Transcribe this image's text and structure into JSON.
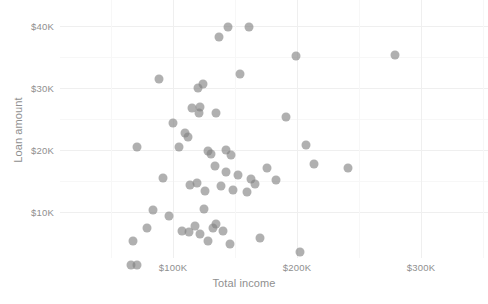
{
  "chart_data": {
    "type": "scatter",
    "title": "",
    "xlabel": "Total income",
    "ylabel": "Loan amount",
    "xlim": [
      28000,
      345000
    ],
    "ylim": [
      500,
      42500
    ],
    "grid": true,
    "legend": false,
    "marker_color": "#808080",
    "marker_opacity": 0.62,
    "gridline_color": "#efefef",
    "axis_text_color": "#8f8f8f",
    "background_color": "#ffffff",
    "x_ticks": [
      {
        "label": "$100K",
        "value": 100000
      },
      {
        "label": "$200K",
        "value": 200000
      },
      {
        "label": "$300K",
        "value": 300000
      }
    ],
    "x_minor_ticks": [
      50000,
      150000,
      250000,
      350000
    ],
    "y_ticks": [
      {
        "label": "$10K",
        "value": 10000
      },
      {
        "label": "$20K",
        "value": 20000
      },
      {
        "label": "$30K",
        "value": 30000
      },
      {
        "label": "$40K",
        "value": 40000
      }
    ],
    "y_minor_ticks": [
      15000,
      25000,
      35000
    ],
    "points": [
      {
        "x": 144000,
        "y": 39900
      },
      {
        "x": 137000,
        "y": 38300
      },
      {
        "x": 161000,
        "y": 39900
      },
      {
        "x": 199000,
        "y": 35100
      },
      {
        "x": 279000,
        "y": 35300
      },
      {
        "x": 191000,
        "y": 25300
      },
      {
        "x": 207000,
        "y": 20800
      },
      {
        "x": 89000,
        "y": 31400
      },
      {
        "x": 124000,
        "y": 30700
      },
      {
        "x": 120000,
        "y": 30000
      },
      {
        "x": 154000,
        "y": 32200
      },
      {
        "x": 115000,
        "y": 26800
      },
      {
        "x": 122000,
        "y": 26900
      },
      {
        "x": 121000,
        "y": 25900
      },
      {
        "x": 135000,
        "y": 25900
      },
      {
        "x": 100000,
        "y": 24300
      },
      {
        "x": 71000,
        "y": 20500
      },
      {
        "x": 105000,
        "y": 20400
      },
      {
        "x": 110000,
        "y": 22700
      },
      {
        "x": 112000,
        "y": 22100
      },
      {
        "x": 128000,
        "y": 19800
      },
      {
        "x": 131000,
        "y": 19300
      },
      {
        "x": 143000,
        "y": 19900
      },
      {
        "x": 147000,
        "y": 19100
      },
      {
        "x": 163000,
        "y": 15300
      },
      {
        "x": 166000,
        "y": 14500
      },
      {
        "x": 176000,
        "y": 17000
      },
      {
        "x": 214000,
        "y": 17700
      },
      {
        "x": 241000,
        "y": 17000
      },
      {
        "x": 183000,
        "y": 15100
      },
      {
        "x": 92000,
        "y": 15400
      },
      {
        "x": 119000,
        "y": 14600
      },
      {
        "x": 134000,
        "y": 17300
      },
      {
        "x": 143000,
        "y": 16400
      },
      {
        "x": 152000,
        "y": 15900
      },
      {
        "x": 148000,
        "y": 13500
      },
      {
        "x": 126000,
        "y": 13300
      },
      {
        "x": 160000,
        "y": 13100
      },
      {
        "x": 84000,
        "y": 10200
      },
      {
        "x": 97000,
        "y": 9200
      },
      {
        "x": 125000,
        "y": 10400
      },
      {
        "x": 79000,
        "y": 7400
      },
      {
        "x": 107000,
        "y": 6900
      },
      {
        "x": 118000,
        "y": 7700
      },
      {
        "x": 132000,
        "y": 7300
      },
      {
        "x": 140000,
        "y": 6800
      },
      {
        "x": 113000,
        "y": 6700
      },
      {
        "x": 122000,
        "y": 6400
      },
      {
        "x": 135000,
        "y": 8000
      },
      {
        "x": 128000,
        "y": 5200
      },
      {
        "x": 146000,
        "y": 4800
      },
      {
        "x": 68000,
        "y": 5200
      },
      {
        "x": 66000,
        "y": 1400
      },
      {
        "x": 71000,
        "y": 1400
      },
      {
        "x": 170000,
        "y": 5800
      },
      {
        "x": 202000,
        "y": 3500
      },
      {
        "x": 114000,
        "y": 14300
      },
      {
        "x": 139000,
        "y": 14100
      }
    ]
  }
}
